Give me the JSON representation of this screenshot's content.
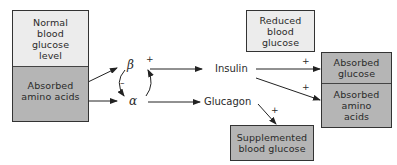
{
  "diagram": {
    "left_box": {
      "top": "Normal blood glucose level",
      "top_lines": [
        "Normal",
        "blood",
        "glucose",
        "level"
      ],
      "bottom_lines": [
        "Absorbed",
        "amino acids"
      ]
    },
    "cells": {
      "beta": "β",
      "alpha": "α"
    },
    "hormones": {
      "insulin": "Insulin",
      "glucagon": "Glucagon"
    },
    "signs": {
      "beta_plus": "+",
      "alpha_beta_minus": "–",
      "insulin_glucose_plus": "+",
      "insulin_amino_plus": "+",
      "glucagon_plus": "+"
    },
    "reduced_box": {
      "lines": [
        "Reduced",
        "blood",
        "glucose"
      ]
    },
    "right_box": {
      "top_lines": [
        "Absorbed",
        "glucose"
      ],
      "bottom_lines": [
        "Absorbed",
        "amino",
        "acids"
      ]
    },
    "supplemented_box": {
      "lines": [
        "Supplemented",
        "blood glucose"
      ]
    },
    "colors": {
      "light_fill": "#ececec",
      "dark_fill": "#b5b5b5",
      "line": "#333333"
    }
  }
}
